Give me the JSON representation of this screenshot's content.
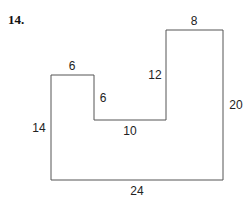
{
  "problem": {
    "number": "14."
  },
  "figure": {
    "shape": "L-shaped polygon (U-shaped notch)",
    "line_color": "#555555",
    "labels": {
      "top_left_width": "6",
      "inner_left_drop": "6",
      "inner_bottom": "10",
      "inner_right_rise": "12",
      "top_right_width": "8",
      "right_height": "20",
      "bottom_width": "24",
      "left_height": "14"
    }
  }
}
